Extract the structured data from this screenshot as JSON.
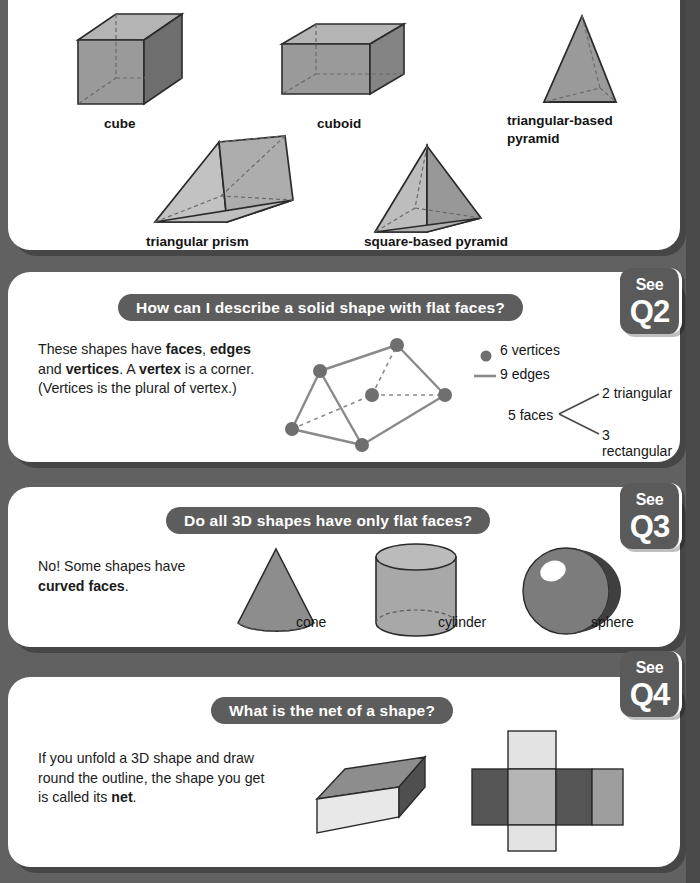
{
  "page": {
    "background_color": "#616161",
    "panel_color": "#ffffff",
    "accent_color": "#5d5d5d"
  },
  "panel1": {
    "shapes": [
      {
        "name": "cube",
        "label": "cube"
      },
      {
        "name": "cuboid",
        "label": "cuboid"
      },
      {
        "name": "triangular-based-pyramid",
        "label": "triangular-based pyramid"
      },
      {
        "name": "triangular-prism",
        "label": "triangular prism"
      },
      {
        "name": "square-based-pyramid",
        "label": "square-based pyramid"
      }
    ]
  },
  "panel2": {
    "heading": "How can I describe a solid shape with flat faces?",
    "badge": {
      "see": "See",
      "q": "Q2"
    },
    "body_line1_a": "These shapes have ",
    "body_b1": "faces",
    "body_line1_b": ", ",
    "body_b2": "edges",
    "body_line1_c": " and",
    "body_b3": "vertices",
    "body_line2_a": ". A ",
    "body_b4": "vertex",
    "body_line2_b": " is a corner.",
    "body_line3": "(Vertices is the plural of vertex.)",
    "legend": {
      "vertices": "6 vertices",
      "edges": "9 edges",
      "faces": "5 faces",
      "faces_triangular": "2 triangular",
      "faces_rectangular": "3 rectangular"
    }
  },
  "panel3": {
    "heading": "Do all 3D shapes have only flat faces?",
    "badge": {
      "see": "See",
      "q": "Q3"
    },
    "body_line1": "No! Some shapes have",
    "body_bold": "curved faces",
    "body_period": ".",
    "shapes": [
      {
        "name": "cone",
        "label": "cone"
      },
      {
        "name": "cylinder",
        "label": "cylinder"
      },
      {
        "name": "sphere",
        "label": "sphere"
      }
    ]
  },
  "panel4": {
    "heading": "What is the net of a shape?",
    "badge": {
      "see": "See",
      "q": "Q4"
    },
    "body_line1": "If you unfold a 3D shape and draw",
    "body_line2": "round the outline, the shape you",
    "body_line3_a": "get is called its ",
    "body_bold": "net",
    "body_line3_b": "."
  }
}
